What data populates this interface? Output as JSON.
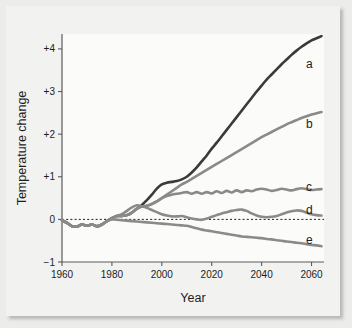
{
  "figure": {
    "background_color": "#ececeb",
    "card_color": "#f2f2f1",
    "plot_background": "#fbfbfa"
  },
  "chart_data": {
    "type": "line",
    "title": "",
    "xlabel": "Year",
    "ylabel": "Temperature change",
    "xlim": [
      1960,
      2065
    ],
    "ylim": [
      -1,
      4.35
    ],
    "grid": false,
    "legend_position": "inline-right-end",
    "xticks": [
      1960,
      1980,
      2000,
      2020,
      2040,
      2060
    ],
    "xtick_labels": [
      "1960",
      "1980",
      "2000",
      "2020",
      "2040",
      "2060"
    ],
    "yticks": [
      -1,
      0,
      1,
      2,
      3,
      4
    ],
    "ytick_labels": [
      "−1",
      "0",
      "+1",
      "+2",
      "+3",
      "+4"
    ],
    "reference_line": {
      "y": 0,
      "style": "dotted",
      "color": "#1d1d1d"
    },
    "x": [
      1960,
      1962,
      1964,
      1966,
      1968,
      1970,
      1972,
      1974,
      1976,
      1978,
      1980,
      1982,
      1984,
      1986,
      1988,
      1990,
      1992,
      1994,
      1996,
      1998,
      2000,
      2002,
      2004,
      2006,
      2008,
      2010,
      2012,
      2014,
      2016,
      2018,
      2020,
      2022,
      2024,
      2026,
      2028,
      2030,
      2032,
      2034,
      2036,
      2038,
      2040,
      2042,
      2044,
      2046,
      2048,
      2050,
      2052,
      2054,
      2056,
      2058,
      2060,
      2062,
      2064
    ],
    "series": [
      {
        "name": "a",
        "label": "a",
        "color": "#3a3a3a",
        "width": 2.6,
        "final_value": 4.25,
        "values": [
          -0.02,
          -0.08,
          -0.16,
          -0.17,
          -0.12,
          -0.15,
          -0.12,
          -0.16,
          -0.12,
          -0.04,
          0.03,
          0.08,
          0.08,
          0.1,
          0.16,
          0.25,
          0.34,
          0.45,
          0.58,
          0.72,
          0.82,
          0.86,
          0.88,
          0.9,
          0.94,
          1.0,
          1.1,
          1.22,
          1.36,
          1.5,
          1.66,
          1.8,
          1.95,
          2.1,
          2.25,
          2.4,
          2.55,
          2.7,
          2.85,
          3.0,
          3.14,
          3.28,
          3.4,
          3.52,
          3.64,
          3.75,
          3.86,
          3.96,
          4.05,
          4.13,
          4.2,
          4.25,
          4.3
        ]
      },
      {
        "name": "b",
        "label": "b",
        "color": "#8a8a8a",
        "width": 2.6,
        "final_value": 2.5,
        "values": [
          -0.02,
          -0.08,
          -0.16,
          -0.17,
          -0.12,
          -0.15,
          -0.12,
          -0.16,
          -0.12,
          -0.04,
          0.03,
          0.08,
          0.08,
          0.1,
          0.16,
          0.25,
          0.3,
          0.32,
          0.36,
          0.42,
          0.5,
          0.58,
          0.66,
          0.74,
          0.82,
          0.88,
          0.95,
          1.02,
          1.09,
          1.16,
          1.23,
          1.3,
          1.37,
          1.44,
          1.51,
          1.58,
          1.65,
          1.72,
          1.79,
          1.86,
          1.93,
          1.99,
          2.05,
          2.11,
          2.17,
          2.23,
          2.28,
          2.33,
          2.38,
          2.42,
          2.46,
          2.49,
          2.52
        ]
      },
      {
        "name": "c",
        "label": "c",
        "color": "#8a8a8a",
        "width": 2.6,
        "final_value": 0.7,
        "values": [
          -0.02,
          -0.08,
          -0.16,
          -0.17,
          -0.12,
          -0.15,
          -0.12,
          -0.16,
          -0.12,
          -0.04,
          0.03,
          0.08,
          0.08,
          0.1,
          0.16,
          0.25,
          0.3,
          0.32,
          0.36,
          0.42,
          0.5,
          0.55,
          0.58,
          0.6,
          0.62,
          0.64,
          0.6,
          0.64,
          0.6,
          0.64,
          0.61,
          0.66,
          0.62,
          0.67,
          0.63,
          0.68,
          0.64,
          0.68,
          0.66,
          0.7,
          0.72,
          0.7,
          0.67,
          0.69,
          0.72,
          0.7,
          0.68,
          0.71,
          0.73,
          0.71,
          0.69,
          0.7,
          0.71
        ]
      },
      {
        "name": "d",
        "label": "d",
        "color": "#8a8a8a",
        "width": 2.6,
        "final_value": 0.1,
        "values": [
          -0.02,
          -0.08,
          -0.16,
          -0.17,
          -0.12,
          -0.15,
          -0.12,
          -0.16,
          -0.12,
          -0.04,
          0.03,
          0.08,
          0.12,
          0.2,
          0.28,
          0.33,
          0.31,
          0.27,
          0.22,
          0.17,
          0.12,
          0.09,
          0.07,
          0.07,
          0.08,
          0.05,
          0.02,
          0.0,
          -0.01,
          0.02,
          0.06,
          0.1,
          0.14,
          0.17,
          0.2,
          0.22,
          0.23,
          0.2,
          0.14,
          0.09,
          0.06,
          0.05,
          0.06,
          0.08,
          0.12,
          0.16,
          0.19,
          0.21,
          0.2,
          0.16,
          0.12,
          0.1,
          0.09
        ]
      },
      {
        "name": "e",
        "label": "e",
        "color": "#8a8a8a",
        "width": 2.6,
        "final_value": -0.62,
        "values": [
          -0.02,
          -0.08,
          -0.16,
          -0.17,
          -0.12,
          -0.15,
          -0.12,
          -0.16,
          -0.12,
          -0.04,
          0.0,
          -0.01,
          -0.02,
          -0.03,
          -0.04,
          -0.05,
          -0.06,
          -0.07,
          -0.08,
          -0.09,
          -0.1,
          -0.11,
          -0.12,
          -0.13,
          -0.14,
          -0.15,
          -0.18,
          -0.21,
          -0.24,
          -0.26,
          -0.28,
          -0.3,
          -0.32,
          -0.34,
          -0.36,
          -0.38,
          -0.4,
          -0.41,
          -0.42,
          -0.43,
          -0.44,
          -0.46,
          -0.47,
          -0.49,
          -0.5,
          -0.52,
          -0.53,
          -0.55,
          -0.56,
          -0.58,
          -0.6,
          -0.61,
          -0.63
        ]
      }
    ]
  }
}
